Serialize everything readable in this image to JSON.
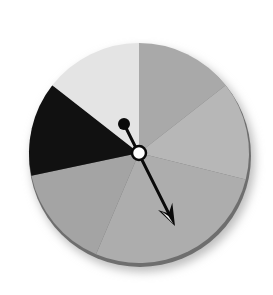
{
  "spinner": {
    "center": {
      "x": 139,
      "y": 153
    },
    "radius": 110,
    "rim_color": "#6e6e6e",
    "shadow_color": "#c8c8c8",
    "segments": [
      {
        "name": "top-right",
        "start": -90,
        "end": -38,
        "color": "#a9a9a9"
      },
      {
        "name": "right",
        "start": -38,
        "end": 14,
        "color": "#b7b7b7"
      },
      {
        "name": "bottom",
        "start": 14,
        "end": 113,
        "color": "#adadad"
      },
      {
        "name": "lower-left",
        "start": 113,
        "end": 168,
        "color": "#a4a4a4"
      },
      {
        "name": "left-black",
        "start": 168,
        "end": 218,
        "color": "#111111"
      },
      {
        "name": "top-left",
        "start": 218,
        "end": 270,
        "color": "#e4e4e4"
      }
    ],
    "arrow": {
      "tail": {
        "x": 124,
        "y": 124
      },
      "tail_radius": 6,
      "tip": {
        "x": 175,
        "y": 226
      },
      "color": "#0a0a0a",
      "pivot_radius": 7,
      "pivot_fill": "#ffffff"
    }
  }
}
